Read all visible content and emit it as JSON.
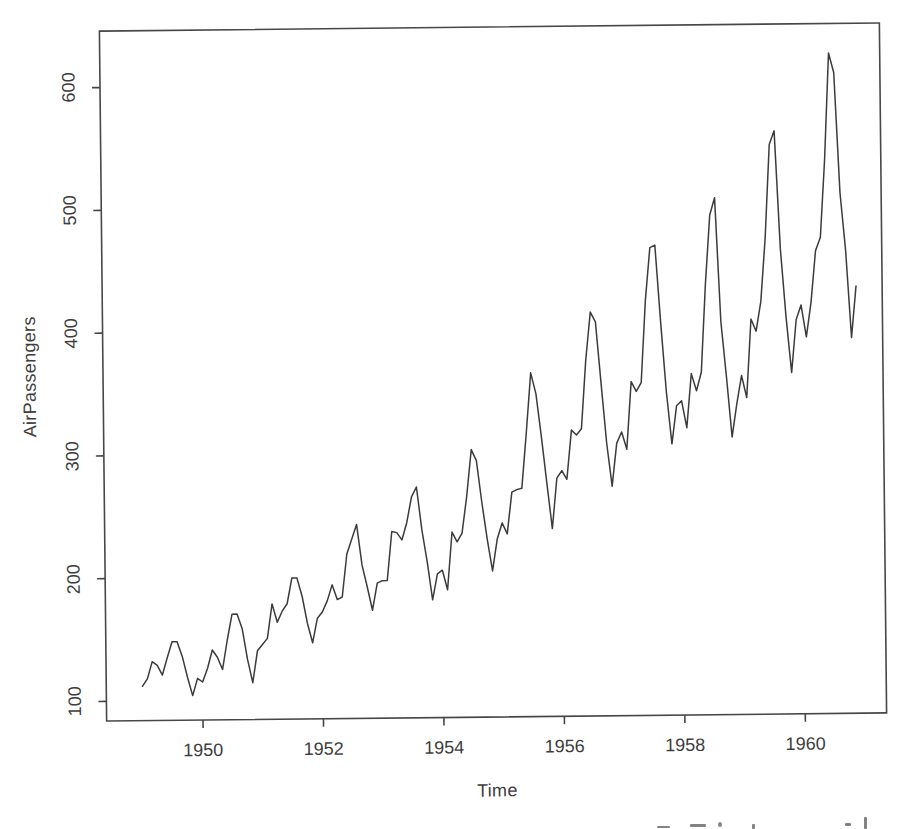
{
  "figure": {
    "background": "#ffffff",
    "line_color": "#3b3b3b",
    "axis_color": "#474747",
    "text_color": "#3d3d3d"
  },
  "chart_data": {
    "type": "line",
    "title": "",
    "xlabel": "Time",
    "ylabel": "AirPassengers",
    "x_start": 1949,
    "frequency": 12,
    "xlim": [
      1948.4,
      1961.35
    ],
    "ylim": [
      84,
      646
    ],
    "x_ticks": [
      1950,
      1952,
      1954,
      1956,
      1958,
      1960
    ],
    "y_ticks": [
      100,
      200,
      300,
      400,
      500,
      600
    ],
    "grid": false,
    "legend": "none",
    "series": [
      {
        "name": "AirPassengers",
        "values": [
          112,
          118,
          132,
          129,
          121,
          135,
          148,
          148,
          136,
          119,
          104,
          118,
          115,
          126,
          141,
          135,
          125,
          149,
          170,
          170,
          158,
          133,
          114,
          140,
          145,
          150,
          178,
          163,
          172,
          178,
          199,
          199,
          184,
          162,
          146,
          166,
          171,
          180,
          193,
          181,
          183,
          218,
          230,
          242,
          209,
          191,
          172,
          194,
          196,
          196,
          236,
          235,
          229,
          243,
          264,
          272,
          237,
          211,
          180,
          201,
          204,
          188,
          235,
          227,
          234,
          264,
          302,
          293,
          259,
          229,
          203,
          229,
          242,
          233,
          267,
          269,
          270,
          315,
          364,
          347,
          312,
          274,
          237,
          278,
          284,
          277,
          317,
          313,
          318,
          374,
          413,
          405,
          355,
          306,
          271,
          306,
          315,
          301,
          356,
          348,
          355,
          422,
          465,
          467,
          404,
          347,
          305,
          336,
          340,
          318,
          362,
          348,
          363,
          435,
          491,
          505,
          404,
          359,
          310,
          337,
          360,
          342,
          406,
          396,
          420,
          472,
          548,
          559,
          463,
          407,
          362,
          405,
          417,
          391,
          419,
          461,
          472,
          535,
          622,
          606,
          508,
          461,
          390,
          432
        ]
      }
    ]
  }
}
